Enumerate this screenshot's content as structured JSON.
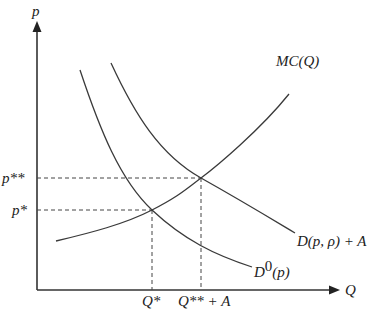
{
  "diagram": {
    "type": "supply-demand",
    "axes": {
      "y_label": "p",
      "x_label": "Q"
    },
    "price_levels": [
      {
        "label": "p**",
        "meaning": "new equilibrium price"
      },
      {
        "label": "p*",
        "meaning": "original equilibrium price"
      }
    ],
    "quantity_levels": [
      {
        "label": "Q*"
      },
      {
        "label": "Q** + A"
      }
    ],
    "curves": [
      {
        "name": "MC(Q)",
        "label": "MC(Q)",
        "shape": "upward-sloping convex"
      },
      {
        "name": "D(p, ρ) + A",
        "label": "D(p, ρ) + A",
        "shape": "downward-sloping convex"
      },
      {
        "name": "D0(p)",
        "label_base": "D",
        "label_sup": "0",
        "label_arg": "(p)",
        "shape": "downward-sloping convex"
      }
    ],
    "equilibria": [
      {
        "curves": [
          "MC(Q)",
          "D0(p)"
        ],
        "price": "p*",
        "quantity": "Q*"
      },
      {
        "curves": [
          "MC(Q)",
          "D(p, ρ) + A"
        ],
        "price": "p**",
        "quantity": "Q** + A"
      }
    ],
    "colors": {
      "line": "#3a3a3a",
      "axis": "#333333",
      "background": "#ffffff"
    }
  }
}
